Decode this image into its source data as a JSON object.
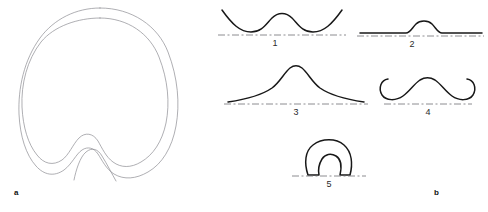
{
  "figure": {
    "background_color": "#ffffff",
    "stroke_color_outline": "#8d8d92",
    "stroke_color_curve": "#181818",
    "baseline_color": "#6f6f74"
  },
  "panels": [
    {
      "key": "a",
      "label": "a",
      "description": "Double-contour closed outline, egg shaped with notched base"
    },
    {
      "key": "b",
      "label": "b",
      "description": "Five numbered profile curves above dashed baselines"
    }
  ],
  "panel_a": {
    "label": "a",
    "shape_name": "double-contour-outline",
    "outer_contour_name": "outer-contour",
    "inner_contour_name": "inner-contour",
    "notch_name": "basal-notch"
  },
  "panel_b": {
    "label": "b",
    "items": [
      {
        "number": "1",
        "name": "profile-double-valley",
        "description": "Two concave valleys flanking a central convex bump, curve rises above baseline at both ends"
      },
      {
        "number": "2",
        "name": "profile-flat-with-bump",
        "description": "Nearly flat line along baseline with a single low central hump"
      },
      {
        "number": "3",
        "name": "profile-peaked-tails",
        "description": "Sharp central peak with long shallow tails descending to the baseline"
      },
      {
        "number": "4",
        "name": "profile-moustache",
        "description": "Central arch with both ends curling upward into hooks"
      },
      {
        "number": "5",
        "name": "profile-closed-arch",
        "description": "Closed horseshoe outline with an inner notch resting on the baseline"
      }
    ]
  }
}
